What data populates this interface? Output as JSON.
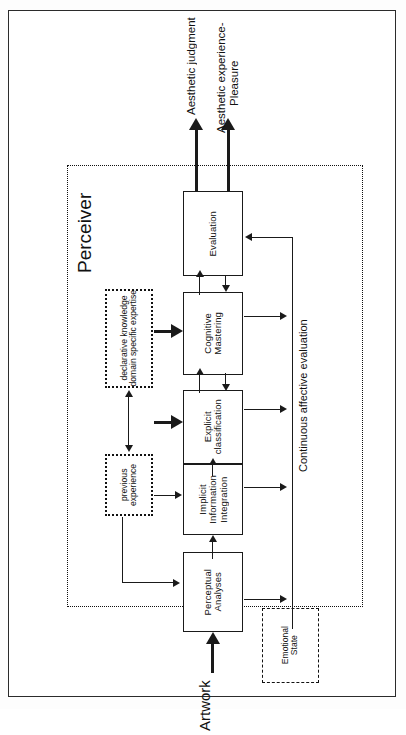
{
  "figure": {
    "orientation": "rotated-90-clockwise",
    "title_absent": true,
    "enclosure_label": "Perceiver",
    "input_label": "Artwork",
    "side_label": "Continuous affective evaluation",
    "outputs": [
      {
        "id": "aesthetic-judgment",
        "label": "Aesthetic judgment"
      },
      {
        "id": "aesthetic-experience",
        "label": "Aesthetic experience-\nPleasure"
      }
    ],
    "process_nodes": [
      {
        "id": "evaluation",
        "label": "Evaluation"
      },
      {
        "id": "cognitive-mastering",
        "label": "Cognitive\nMastering"
      },
      {
        "id": "explicit-classification",
        "label": "Explicit\nclassification"
      },
      {
        "id": "implicit-information-integration",
        "label": "Implicit\nInformation\nIntegration"
      },
      {
        "id": "perceptual-analyses",
        "label": "Perceptual\nAnalyses"
      }
    ],
    "memory_nodes": [
      {
        "id": "declarative-knowledge",
        "label": "declarative knowledge\ndomain specific expertise",
        "border": "dotted"
      },
      {
        "id": "previous-experience",
        "label": "previous\nexperience",
        "border": "dotted"
      }
    ],
    "affect_nodes": [
      {
        "id": "emotional-state",
        "label": "Emotional\nState",
        "border": "dashed"
      }
    ],
    "colors": {
      "stroke": "#1a1a1a",
      "frame": "#2b2b2b",
      "background": "#ffffff"
    }
  }
}
